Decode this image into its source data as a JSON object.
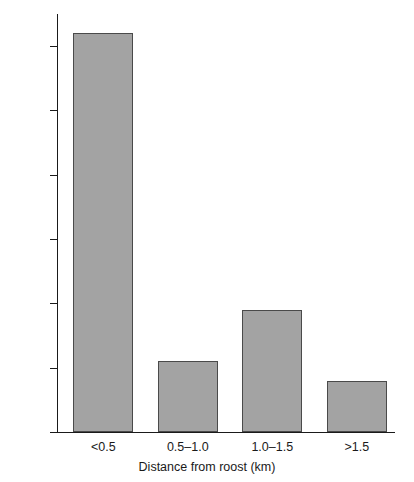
{
  "chart_data": {
    "type": "bar",
    "title": "",
    "subtitle": "",
    "xlabel": "Distance from roost (km)",
    "ylabel": "% of total foraging time",
    "categories": [
      "<0.5",
      "0.5–1.0",
      "1.0–1.5",
      ">1.5"
    ],
    "values": [
      62,
      11,
      19,
      8
    ],
    "series": [
      {
        "name": "% of total foraging time",
        "values": [
          62,
          11,
          19,
          8
        ]
      }
    ],
    "ylim": [
      0,
      65
    ],
    "yticks": [
      0,
      10,
      20,
      30,
      40,
      50,
      60
    ],
    "ytick_labels": [
      "0",
      "10",
      "20",
      "30",
      "40",
      "50",
      "60"
    ],
    "grid": false,
    "legend": false,
    "legend_position": "none",
    "bar_fill_color": "#a3a3a3",
    "bar_edge_color": "#4a4a4a",
    "axis_color": "#1a1a1a",
    "background_color": "#ffffff"
  }
}
